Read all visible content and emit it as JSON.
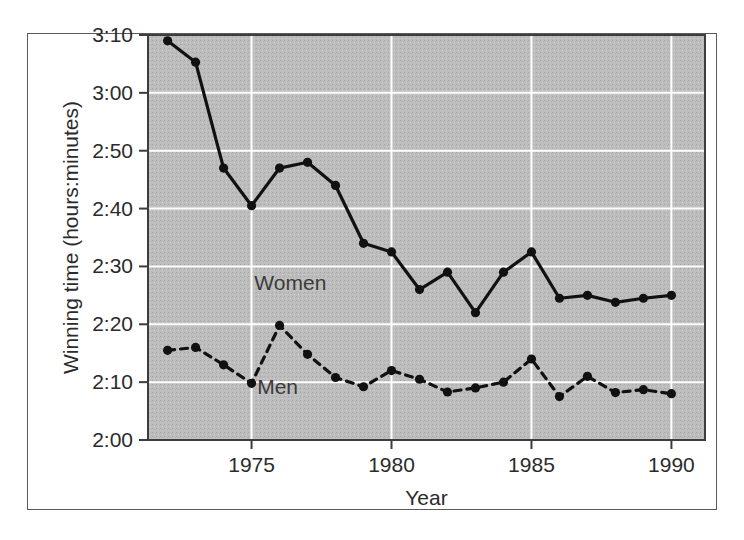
{
  "chart_data": {
    "type": "line",
    "title": "",
    "xlabel": "Year",
    "ylabel": "Winning time (hours:minutes)",
    "xlim": [
      1971.3,
      1991.2
    ],
    "ylim": [
      120,
      190
    ],
    "xticks": [
      1975,
      1980,
      1985,
      1990
    ],
    "xticklabels": [
      "1975",
      "1980",
      "1985",
      "1990"
    ],
    "yticks": [
      120,
      130,
      140,
      150,
      160,
      170,
      180,
      190
    ],
    "yticklabels": [
      "2:00",
      "2:10",
      "2:20",
      "2:30",
      "2:40",
      "2:50",
      "3:00",
      "3:10"
    ],
    "grid": true,
    "grid_color": "#ffffff",
    "plot_background": "#bdbdbd",
    "line_color": "#111111",
    "legend_position": "inline-annotations",
    "annotations": [
      {
        "text": "Women",
        "x": 1975.1,
        "y": 146.0
      },
      {
        "text": "Men",
        "x": 1975.2,
        "y": 128.0
      }
    ],
    "x": [
      1972,
      1973,
      1974,
      1975,
      1976,
      1977,
      1978,
      1979,
      1980,
      1981,
      1982,
      1983,
      1984,
      1985,
      1986,
      1987,
      1988,
      1989,
      1990
    ],
    "series": [
      {
        "name": "Women",
        "style": "solid",
        "values": [
          189.0,
          185.3,
          167.0,
          160.5,
          167.0,
          168.0,
          164.0,
          154.0,
          152.5,
          146.0,
          149.0,
          142.0,
          149.0,
          152.5,
          144.5,
          145.0,
          143.8,
          144.5,
          145.0
        ],
        "labels": [
          "3:09",
          "3:05",
          "2:47",
          "2:40",
          "2:47",
          "2:48",
          "2:44",
          "2:34",
          "2:32",
          "2:26",
          "2:29",
          "2:22",
          "2:29",
          "2:32",
          "2:24",
          "2:25",
          "2:24",
          "2:24",
          "2:25"
        ]
      },
      {
        "name": "Men",
        "style": "dashed",
        "values": [
          135.5,
          136.0,
          133.0,
          129.8,
          139.8,
          134.8,
          130.8,
          129.2,
          132.0,
          130.5,
          128.3,
          129.0,
          130.0,
          134.0,
          127.5,
          131.0,
          128.2,
          128.7,
          128.0
        ],
        "labels": [
          "2:15",
          "2:16",
          "2:13",
          "2:09",
          "2:19",
          "2:14",
          "2:10",
          "2:09",
          "2:12",
          "2:10",
          "2:08",
          "2:09",
          "2:10",
          "2:14",
          "2:07",
          "2:11",
          "2:08",
          "2:08",
          "2:08"
        ]
      }
    ]
  }
}
